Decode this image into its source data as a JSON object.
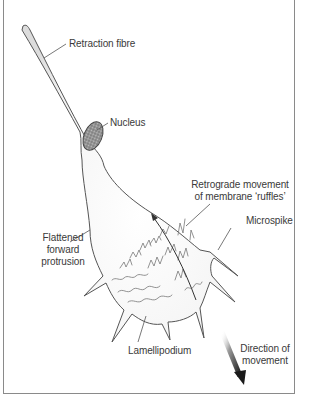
{
  "figure": {
    "labels": {
      "retraction_fibre": "Retraction fibre",
      "nucleus": "Nucleus",
      "retrograde_line1": "Retrograde movement",
      "retrograde_line2": "of membrane ‘ruffles’",
      "microspike": "Microspike",
      "flattened_line1": "Flattened",
      "flattened_line2": "forward",
      "flattened_line3": "protrusion",
      "lamellipodium": "Lamellipodium",
      "direction_line1": "Direction of",
      "direction_line2": "movement"
    },
    "colors": {
      "outline": "#555555",
      "cell_fill": "#f4f4f4",
      "nucleus_fill": "#8c8c8c",
      "frame": "#8a8a8a",
      "arrow": "#222222"
    }
  }
}
